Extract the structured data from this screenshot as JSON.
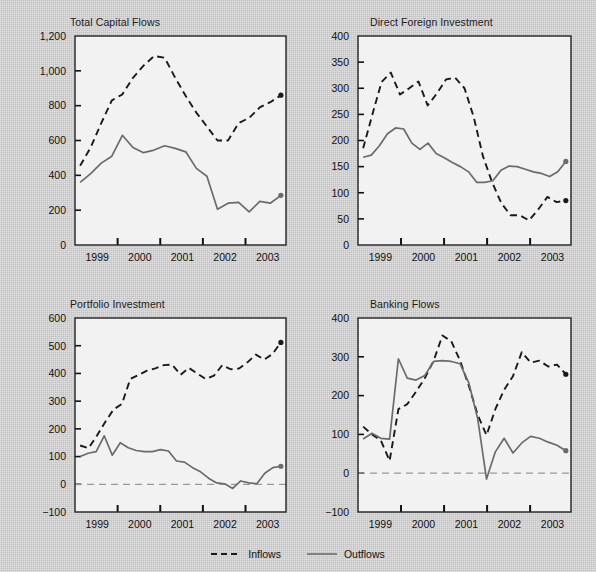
{
  "figure": {
    "background_color": "#c7c7c7",
    "plot_background_color": "#f2f2f2",
    "inflow_color": "#1a1a1a",
    "outflow_color": "#6b6b6b"
  },
  "legend": {
    "position": "bottom-center",
    "items": [
      {
        "label": "Inflows",
        "style": "dashed",
        "color": "#1a1a1a",
        "name": "legend-inflows"
      },
      {
        "label": "Outflows",
        "style": "solid",
        "color": "#6b6b6b",
        "name": "legend-outflows"
      }
    ]
  },
  "chart_data": [
    {
      "type": "line",
      "title": "Total Capital Flows",
      "xlabel": "",
      "ylabel": "Billions of U.S. $",
      "ylim": [
        0,
        1200
      ],
      "yticks": [
        0,
        200,
        400,
        600,
        800,
        1000,
        1200
      ],
      "ytick_labels": [
        "0",
        "200",
        "400",
        "600",
        "800",
        "1,000",
        "1,200"
      ],
      "xlim": [
        1998.5,
        2003.45
      ],
      "xticks": [
        1999,
        2000,
        2001,
        2002,
        2003
      ],
      "xtick_labels": [
        "1999",
        "2000",
        "2001",
        "2002",
        "2003"
      ],
      "grid": false,
      "x": [
        1998.62,
        1998.87,
        1999.12,
        1999.37,
        1999.62,
        1999.87,
        2000.12,
        2000.37,
        2000.62,
        2000.87,
        2001.12,
        2001.37,
        2001.62,
        2001.87,
        2002.12,
        2002.37,
        2002.62,
        2002.87,
        2003.12,
        2003.37
      ],
      "series": [
        {
          "name": "Inflows",
          "style": "dashed",
          "values": [
            455,
            560,
            700,
            830,
            865,
            960,
            1030,
            1085,
            1075,
            960,
            855,
            760,
            680,
            600,
            600,
            700,
            730,
            790,
            820,
            860
          ],
          "endpoint_marker": true
        },
        {
          "name": "Outflows",
          "style": "solid",
          "values": [
            360,
            410,
            470,
            510,
            630,
            560,
            530,
            545,
            570,
            555,
            535,
            440,
            395,
            205,
            240,
            245,
            190,
            250,
            240,
            285
          ],
          "endpoint_marker": true
        }
      ]
    },
    {
      "type": "line",
      "title": "Direct Foreign Investment",
      "xlabel": "",
      "ylabel": "Billions of U.S. $",
      "ylim": [
        0,
        400
      ],
      "yticks": [
        0,
        50,
        100,
        150,
        200,
        250,
        300,
        350,
        400
      ],
      "ytick_labels": [
        "0",
        "50",
        "100",
        "150",
        "200",
        "250",
        "300",
        "350",
        "400"
      ],
      "xlim": [
        1998.5,
        2003.45
      ],
      "xticks": [
        1999,
        2000,
        2001,
        2002,
        2003
      ],
      "xtick_labels": [
        "1999",
        "2000",
        "2001",
        "2002",
        "2003"
      ],
      "grid": false,
      "x": [
        1998.62,
        1998.87,
        1999.12,
        1999.37,
        1999.62,
        1999.87,
        2000.12,
        2000.37,
        2000.62,
        2000.87,
        2001.12,
        2001.37,
        2001.62,
        2001.87,
        2002.12,
        2002.37,
        2002.62,
        2002.87,
        2003.12,
        2003.37
      ],
      "series": [
        {
          "name": "Inflows",
          "style": "dashed",
          "values": [
            185,
            250,
            312,
            330,
            288,
            300,
            313,
            267,
            290,
            317,
            320,
            300,
            245,
            170,
            120,
            80,
            57,
            57,
            47,
            68,
            92,
            82,
            85
          ],
          "endpoint_marker": true
        },
        {
          "name": "Outflows",
          "style": "solid",
          "values": [
            168,
            172,
            190,
            213,
            224,
            222,
            195,
            183,
            195,
            175,
            167,
            158,
            150,
            140,
            120,
            120,
            123,
            143,
            151,
            150,
            145,
            140,
            137,
            131,
            140,
            160
          ],
          "endpoint_marker": true
        }
      ]
    },
    {
      "type": "line",
      "title": "Portfolio Investment",
      "xlabel": "",
      "ylabel": "Billions of U.S. $",
      "ylim": [
        -100,
        600
      ],
      "yticks": [
        -100,
        0,
        100,
        200,
        300,
        400,
        500,
        600
      ],
      "ytick_labels": [
        "−100",
        "0",
        "100",
        "200",
        "300",
        "400",
        "500",
        "600"
      ],
      "xlim": [
        1998.5,
        2003.45
      ],
      "xticks": [
        1999,
        2000,
        2001,
        2002,
        2003
      ],
      "xtick_labels": [
        "1999",
        "2000",
        "2001",
        "2002",
        "2003"
      ],
      "grid": false,
      "zero_line": true,
      "x": [
        1998.62,
        1998.87,
        1999.12,
        1999.37,
        1999.62,
        1999.87,
        2000.12,
        2000.37,
        2000.62,
        2000.87,
        2001.12,
        2001.37,
        2001.62,
        2001.87,
        2002.12,
        2002.37,
        2002.62,
        2002.87,
        2003.12,
        2003.37
      ],
      "series": [
        {
          "name": "Inflows",
          "style": "dashed",
          "values": [
            140,
            130,
            175,
            225,
            270,
            290,
            380,
            395,
            410,
            418,
            430,
            432,
            395,
            420,
            400,
            380,
            392,
            430,
            415,
            418,
            440,
            468,
            450,
            470,
            512
          ],
          "endpoint_marker": true
        },
        {
          "name": "Outflows",
          "style": "solid",
          "values": [
            100,
            112,
            118,
            175,
            105,
            150,
            132,
            122,
            118,
            118,
            125,
            120,
            84,
            80,
            60,
            45,
            22,
            5,
            2,
            -15,
            12,
            5,
            2,
            40,
            60,
            65
          ],
          "endpoint_marker": true
        }
      ]
    },
    {
      "type": "line",
      "title": "Banking Flows",
      "xlabel": "",
      "ylabel": "Billions of U.S. $",
      "ylim": [
        -100,
        400
      ],
      "yticks": [
        -100,
        0,
        100,
        200,
        300,
        400
      ],
      "ytick_labels": [
        "−100",
        "0",
        "100",
        "200",
        "300",
        "400"
      ],
      "xlim": [
        1998.5,
        2003.45
      ],
      "xticks": [
        1999,
        2000,
        2001,
        2002,
        2003
      ],
      "xtick_labels": [
        "1999",
        "2000",
        "2001",
        "2002",
        "2003"
      ],
      "grid": false,
      "zero_line": true,
      "x": [
        1998.62,
        1998.87,
        1999.12,
        1999.37,
        1999.62,
        1999.87,
        2000.12,
        2000.37,
        2000.62,
        2000.87,
        2001.12,
        2001.37,
        2001.62,
        2001.87,
        2002.12,
        2002.37,
        2002.62,
        2002.87,
        2003.12,
        2003.37
      ],
      "series": [
        {
          "name": "Inflows",
          "style": "dashed",
          "values": [
            120,
            100,
            85,
            32,
            165,
            178,
            210,
            245,
            290,
            355,
            340,
            290,
            225,
            150,
            98,
            165,
            215,
            250,
            312,
            285,
            290,
            275,
            280,
            255
          ],
          "endpoint_marker": true
        },
        {
          "name": "Outflows",
          "style": "solid",
          "values": [
            88,
            103,
            90,
            88,
            295,
            245,
            240,
            252,
            288,
            290,
            288,
            282,
            232,
            140,
            -15,
            55,
            90,
            52,
            78,
            95,
            90,
            80,
            72,
            58
          ],
          "endpoint_marker": true
        }
      ]
    }
  ]
}
